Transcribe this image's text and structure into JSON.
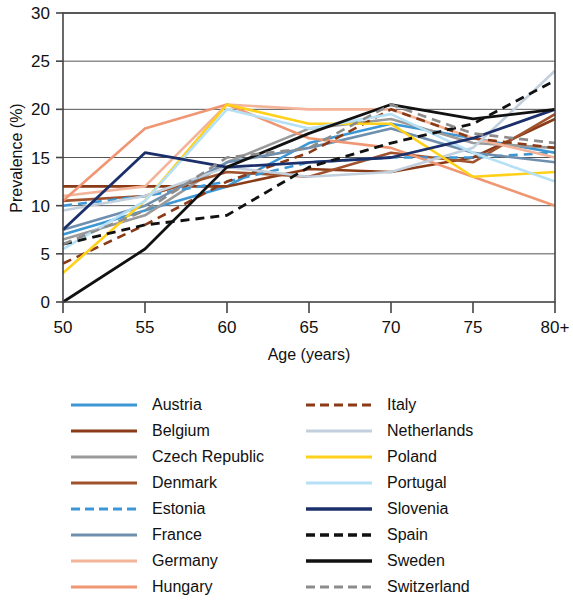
{
  "chart_data": {
    "type": "line",
    "title": "",
    "xlabel": "Age (years)",
    "ylabel": "Prevalence (%)",
    "x": [
      50,
      55,
      60,
      65,
      70,
      75,
      80
    ],
    "xtick_labels": [
      "50",
      "55",
      "60",
      "65",
      "70",
      "75",
      "80+"
    ],
    "ytick_labels": [
      "0",
      "5",
      "10",
      "15",
      "20",
      "25",
      "30"
    ],
    "ytick_values": [
      0,
      5,
      10,
      15,
      20,
      25,
      30
    ],
    "xlim": [
      50,
      80
    ],
    "ylim": [
      0,
      30
    ],
    "grid": "horizontal",
    "legend_position": "below",
    "series": [
      {
        "name": "Austria",
        "color": "#3d97d4",
        "dash": "solid",
        "width": 2.6,
        "values": [
          7.0,
          9.5,
          12.0,
          16.5,
          18.5,
          17.0,
          15.5
        ]
      },
      {
        "name": "Belgium",
        "color": "#8a3a16",
        "dash": "solid",
        "width": 2.6,
        "values": [
          12.0,
          12.0,
          12.0,
          13.8,
          13.5,
          15.0,
          19.0
        ]
      },
      {
        "name": "Czech Republic",
        "color": "#9a9a9a",
        "dash": "solid",
        "width": 2.6,
        "values": [
          6.5,
          9.0,
          14.5,
          18.0,
          19.0,
          16.5,
          16.0
        ]
      },
      {
        "name": "Denmark",
        "color": "#a0522d",
        "dash": "solid",
        "width": 2.6,
        "values": [
          10.5,
          11.0,
          13.5,
          13.0,
          15.5,
          14.5,
          19.5
        ]
      },
      {
        "name": "Estonia",
        "color": "#3d97d4",
        "dash": "dashed",
        "width": 2.6,
        "values": [
          10.0,
          11.0,
          12.5,
          14.5,
          15.0,
          15.0,
          15.5
        ]
      },
      {
        "name": "France",
        "color": "#6f8fae",
        "dash": "solid",
        "width": 2.6,
        "values": [
          7.5,
          10.0,
          14.5,
          16.0,
          18.0,
          15.5,
          14.5
        ]
      },
      {
        "name": "Germany",
        "color": "#f4b49a",
        "dash": "solid",
        "width": 2.6,
        "values": [
          11.0,
          12.0,
          20.5,
          20.0,
          20.0,
          17.0,
          15.0
        ]
      },
      {
        "name": "Hungary",
        "color": "#ef9673",
        "dash": "solid",
        "width": 2.6,
        "values": [
          10.5,
          18.0,
          20.5,
          17.0,
          16.0,
          13.0,
          10.0
        ]
      },
      {
        "name": "Italy",
        "color": "#8a3a16",
        "dash": "dashed",
        "width": 2.6,
        "values": [
          4.0,
          8.0,
          12.5,
          15.5,
          20.0,
          17.0,
          16.0
        ]
      },
      {
        "name": "Netherlands",
        "color": "#c2cfdd",
        "dash": "solid",
        "width": 2.6,
        "values": [
          9.5,
          11.0,
          14.0,
          13.0,
          13.5,
          16.0,
          24.0
        ]
      },
      {
        "name": "Poland",
        "color": "#ffd11a",
        "dash": "solid",
        "width": 2.6,
        "values": [
          3.0,
          10.5,
          20.5,
          18.5,
          18.5,
          13.0,
          13.5
        ]
      },
      {
        "name": "Portugal",
        "color": "#b5e0f5",
        "dash": "solid",
        "width": 2.6,
        "values": [
          5.5,
          10.5,
          20.0,
          18.0,
          19.5,
          15.5,
          12.5
        ]
      },
      {
        "name": "Slovenia",
        "color": "#1b2f6b",
        "dash": "solid",
        "width": 2.8,
        "values": [
          7.5,
          15.5,
          14.0,
          14.5,
          15.0,
          17.0,
          20.0
        ]
      },
      {
        "name": "Spain",
        "color": "#111111",
        "dash": "dashed",
        "width": 2.8,
        "values": [
          6.0,
          8.0,
          9.0,
          14.0,
          16.5,
          18.5,
          23.0
        ]
      },
      {
        "name": "Sweden",
        "color": "#111111",
        "dash": "solid",
        "width": 2.8,
        "values": [
          0.0,
          5.5,
          14.0,
          17.5,
          20.5,
          19.0,
          20.0
        ]
      },
      {
        "name": "Switzerland",
        "color": "#8c8c8c",
        "dash": "dashed",
        "width": 2.6,
        "values": [
          6.0,
          9.5,
          15.0,
          16.0,
          20.5,
          17.5,
          16.5
        ]
      }
    ]
  },
  "legend": {
    "columns": [
      {
        "items": [
          {
            "label": "Austria",
            "series": 0
          },
          {
            "label": "Belgium",
            "series": 1
          },
          {
            "label": "Czech Republic",
            "series": 2
          },
          {
            "label": "Denmark",
            "series": 3
          },
          {
            "label": "Estonia",
            "series": 4
          },
          {
            "label": "France",
            "series": 5
          },
          {
            "label": "Germany",
            "series": 6
          },
          {
            "label": "Hungary",
            "series": 7
          }
        ]
      },
      {
        "items": [
          {
            "label": "Italy",
            "series": 8
          },
          {
            "label": "Netherlands",
            "series": 9
          },
          {
            "label": "Poland",
            "series": 10
          },
          {
            "label": "Portugal",
            "series": 11
          },
          {
            "label": "Slovenia",
            "series": 12
          },
          {
            "label": "Spain",
            "series": 13
          },
          {
            "label": "Sweden",
            "series": 14
          },
          {
            "label": "Switzerland",
            "series": 15
          }
        ]
      }
    ]
  },
  "colors": {
    "axis": "#444444",
    "grid": "#555555",
    "text": "#111111",
    "background": "#ffffff"
  }
}
